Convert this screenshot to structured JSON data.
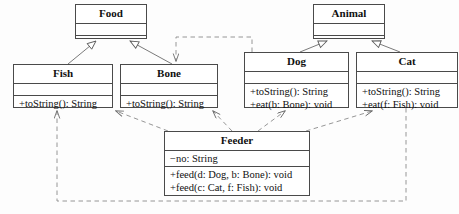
{
  "diagram": {
    "type": "uml-class-diagram",
    "background_color": "#fdfdfd",
    "line_color": "#4a4a4a",
    "text_color": "#101010"
  },
  "classes": [
    {
      "id": "food",
      "name": "Food",
      "attributes": [],
      "methods": [],
      "x": 75,
      "y": 4,
      "w": 72,
      "h": 35
    },
    {
      "id": "animal",
      "name": "Animal",
      "attributes": [],
      "methods": [],
      "x": 313,
      "y": 4,
      "w": 72,
      "h": 35
    },
    {
      "id": "fish",
      "name": "Fish",
      "attributes": [],
      "methods": [
        "+toString(): String"
      ],
      "x": 13,
      "y": 64,
      "w": 100,
      "h": 44
    },
    {
      "id": "bone",
      "name": "Bone",
      "attributes": [],
      "methods": [
        "+toString(): String"
      ],
      "x": 120,
      "y": 64,
      "w": 98,
      "h": 44
    },
    {
      "id": "dog",
      "name": "Dog",
      "attributes": [],
      "methods": [
        "+toString(): String",
        "+eat(b: Bone): void"
      ],
      "x": 244,
      "y": 52,
      "w": 105,
      "h": 56
    },
    {
      "id": "cat",
      "name": "Cat",
      "attributes": [],
      "methods": [
        "+toString(): String",
        "+eat(f: Fish): void"
      ],
      "x": 356,
      "y": 52,
      "w": 102,
      "h": 56
    },
    {
      "id": "feeder",
      "name": "Feeder",
      "attributes": [
        "−no: String"
      ],
      "methods": [
        "+feed(d: Dog, b: Bone): void",
        "+feed(c: Cat, f: Fish): void"
      ],
      "x": 164,
      "y": 131,
      "w": 146,
      "h": 65
    }
  ],
  "relationships": [
    {
      "id": "fish-food",
      "type": "generalization",
      "from": "Fish",
      "to": "Food",
      "style": "solid",
      "arrow": "hollow-triangle"
    },
    {
      "id": "bone-food",
      "type": "generalization",
      "from": "Bone",
      "to": "Food",
      "style": "solid",
      "arrow": "hollow-triangle"
    },
    {
      "id": "dog-animal",
      "type": "generalization",
      "from": "Dog",
      "to": "Animal",
      "style": "solid",
      "arrow": "hollow-triangle"
    },
    {
      "id": "cat-animal",
      "type": "generalization",
      "from": "Cat",
      "to": "Animal",
      "style": "solid",
      "arrow": "hollow-triangle"
    },
    {
      "id": "dog-bone",
      "type": "dependency",
      "from": "Dog",
      "to": "Bone",
      "style": "dashed",
      "arrow": "open"
    },
    {
      "id": "cat-fish",
      "type": "dependency",
      "from": "Cat",
      "to": "Fish",
      "style": "dashed",
      "arrow": "open"
    },
    {
      "id": "feeder-fish",
      "type": "dependency",
      "from": "Feeder",
      "to": "Fish",
      "style": "dashed",
      "arrow": "open"
    },
    {
      "id": "feeder-bone",
      "type": "dependency",
      "from": "Feeder",
      "to": "Bone",
      "style": "dashed",
      "arrow": "open"
    },
    {
      "id": "feeder-dog",
      "type": "dependency",
      "from": "Feeder",
      "to": "Dog",
      "style": "dashed",
      "arrow": "open"
    },
    {
      "id": "feeder-cat",
      "type": "dependency",
      "from": "Feeder",
      "to": "Cat",
      "style": "dashed",
      "arrow": "open"
    }
  ]
}
